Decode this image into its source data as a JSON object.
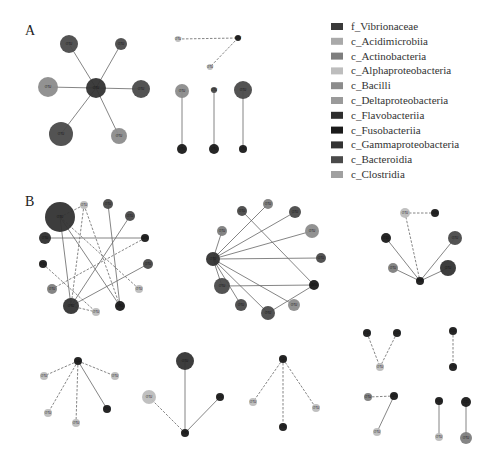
{
  "panels": [
    {
      "id": "A",
      "label": "A"
    },
    {
      "id": "B",
      "label": "B"
    }
  ],
  "legend": {
    "items": [
      {
        "label": "f_Vibrionaceae",
        "color": "#3a3a3a"
      },
      {
        "label": "c_Acidimicrobiia",
        "color": "#a9a9a9"
      },
      {
        "label": "c_Actinobacteria",
        "color": "#7e7e7e"
      },
      {
        "label": "c_Alphaproteobacteria",
        "color": "#bdbdbd"
      },
      {
        "label": "c_Bacilli",
        "color": "#8c8c8c"
      },
      {
        "label": "c_Deltaproteobacteria",
        "color": "#9a9a9a"
      },
      {
        "label": "c_Flavobacteriia",
        "color": "#2e2e2e"
      },
      {
        "label": "c_Fusobacteriia",
        "color": "#1a1a1a"
      },
      {
        "label": "c_Gammaproteobacteria",
        "color": "#333333"
      },
      {
        "label": "c_Bacteroidia",
        "color": "#4a4a4a"
      },
      {
        "label": "c_Clostridia",
        "color": "#a0a0a0"
      }
    ]
  },
  "edge_styles": {
    "positive": "solid",
    "negative": "dashed"
  },
  "networks": [
    {
      "panel": "A",
      "nodes": [
        {
          "id": "a1c",
          "label": "OTU",
          "cls": 8,
          "x": 96,
          "y": 88,
          "r": 10
        },
        {
          "id": "a1n1",
          "label": "OTU",
          "cls": 9,
          "x": 69,
          "y": 44,
          "r": 9
        },
        {
          "id": "a1n2",
          "label": "OTU",
          "cls": 9,
          "x": 121,
          "y": 44,
          "r": 6
        },
        {
          "id": "a1n3",
          "label": "OTU",
          "cls": 4,
          "x": 48,
          "y": 87,
          "r": 10
        },
        {
          "id": "a1n4",
          "label": "OTU",
          "cls": 9,
          "x": 141,
          "y": 89,
          "r": 9
        },
        {
          "id": "a1n5",
          "label": "OTU",
          "cls": 9,
          "x": 61,
          "y": 134,
          "r": 12
        },
        {
          "id": "a1n6",
          "label": "OTU",
          "cls": 4,
          "x": 119,
          "y": 136,
          "r": 8
        }
      ],
      "edges": [
        [
          "a1c",
          "a1n1",
          "solid"
        ],
        [
          "a1c",
          "a1n2",
          "solid"
        ],
        [
          "a1c",
          "a1n3",
          "solid"
        ],
        [
          "a1c",
          "a1n4",
          "solid"
        ],
        [
          "a1c",
          "a1n5",
          "solid"
        ],
        [
          "a1c",
          "a1n6",
          "solid"
        ]
      ]
    },
    {
      "panel": "A",
      "nodes": [
        {
          "id": "a2a",
          "label": "OTU",
          "cls": 3,
          "x": 178,
          "y": 39,
          "r": 3
        },
        {
          "id": "a2b",
          "label": "OTU",
          "cls": 7,
          "x": 238,
          "y": 38,
          "r": 3
        },
        {
          "id": "a2c",
          "label": "OTU",
          "cls": 3,
          "x": 210,
          "y": 67,
          "r": 3
        }
      ],
      "edges": [
        [
          "a2a",
          "a2b",
          "dashed"
        ],
        [
          "a2b",
          "a2c",
          "dashed"
        ]
      ]
    },
    {
      "panel": "A",
      "nodes": [
        {
          "id": "a3a",
          "label": "OTU",
          "cls": 4,
          "x": 182,
          "y": 91,
          "r": 7
        },
        {
          "id": "a3b",
          "label": "OTU",
          "cls": 7,
          "x": 182,
          "y": 149,
          "r": 5
        },
        {
          "id": "a3c",
          "label": "OTU",
          "cls": 9,
          "x": 214,
          "y": 90,
          "r": 3
        },
        {
          "id": "a3d",
          "label": "OTU",
          "cls": 7,
          "x": 214,
          "y": 149,
          "r": 5
        },
        {
          "id": "a3e",
          "label": "OTU",
          "cls": 9,
          "x": 243,
          "y": 90,
          "r": 9
        },
        {
          "id": "a3f",
          "label": "OTU",
          "cls": 7,
          "x": 243,
          "y": 149,
          "r": 4
        }
      ],
      "edges": [
        [
          "a3a",
          "a3b",
          "solid"
        ],
        [
          "a3c",
          "a3d",
          "solid"
        ],
        [
          "a3e",
          "a3f",
          "solid"
        ]
      ]
    },
    {
      "panel": "B",
      "nodes": [
        {
          "id": "b1a",
          "label": "OTU",
          "cls": 8,
          "x": 60,
          "y": 217,
          "r": 15
        },
        {
          "id": "b1b",
          "label": "OTU",
          "cls": 3,
          "x": 84,
          "y": 205,
          "r": 4
        },
        {
          "id": "b1c",
          "label": "OTU",
          "cls": 9,
          "x": 108,
          "y": 204,
          "r": 5
        },
        {
          "id": "b1d",
          "label": "OTU",
          "cls": 9,
          "x": 130,
          "y": 216,
          "r": 5
        },
        {
          "id": "b1e",
          "label": "OTU",
          "cls": 6,
          "x": 45,
          "y": 238,
          "r": 6
        },
        {
          "id": "b1f",
          "label": "OTU",
          "cls": 7,
          "x": 145,
          "y": 238,
          "r": 4
        },
        {
          "id": "b1g",
          "label": "OTU",
          "cls": 7,
          "x": 43,
          "y": 264,
          "r": 4
        },
        {
          "id": "b1h",
          "label": "OTU",
          "cls": 9,
          "x": 148,
          "y": 264,
          "r": 5
        },
        {
          "id": "b1i",
          "label": "OTU",
          "cls": 2,
          "x": 52,
          "y": 289,
          "r": 5
        },
        {
          "id": "b1j",
          "label": "OTU",
          "cls": 3,
          "x": 139,
          "y": 289,
          "r": 4
        },
        {
          "id": "b1k",
          "label": "OTU",
          "cls": 8,
          "x": 71,
          "y": 306,
          "r": 8
        },
        {
          "id": "b1l",
          "label": "OTU",
          "cls": 3,
          "x": 96,
          "y": 312,
          "r": 4
        },
        {
          "id": "b1m",
          "label": "OTU",
          "cls": 7,
          "x": 120,
          "y": 306,
          "r": 5
        }
      ],
      "edges": [
        [
          "b1a",
          "b1b",
          "dashed"
        ],
        [
          "b1a",
          "b1k",
          "solid"
        ],
        [
          "b1a",
          "b1m",
          "solid"
        ],
        [
          "b1a",
          "b1j",
          "dashed"
        ],
        [
          "b1e",
          "b1f",
          "solid"
        ],
        [
          "b1c",
          "b1m",
          "solid"
        ],
        [
          "b1d",
          "b1k",
          "solid"
        ],
        [
          "b1h",
          "b1k",
          "solid"
        ],
        [
          "b1b",
          "b1k",
          "dashed"
        ],
        [
          "b1b",
          "b1m",
          "dashed"
        ],
        [
          "b1f",
          "b1i",
          "dashed"
        ],
        [
          "b1g",
          "b1l",
          "dashed"
        ],
        [
          "b1k",
          "b1l",
          "dashed"
        ]
      ]
    },
    {
      "panel": "B",
      "nodes": [
        {
          "id": "b2c",
          "label": "OTU",
          "cls": 8,
          "x": 213,
          "y": 259,
          "r": 7
        },
        {
          "id": "b2a",
          "label": "OTU",
          "cls": 9,
          "x": 242,
          "y": 211,
          "r": 5
        },
        {
          "id": "b2b",
          "label": "OTU",
          "cls": 2,
          "x": 268,
          "y": 204,
          "r": 5
        },
        {
          "id": "b2d",
          "label": "OTU",
          "cls": 9,
          "x": 295,
          "y": 212,
          "r": 6
        },
        {
          "id": "b2e",
          "label": "OTU",
          "cls": 2,
          "x": 222,
          "y": 231,
          "r": 5
        },
        {
          "id": "b2f",
          "label": "OTU",
          "cls": 4,
          "x": 312,
          "y": 231,
          "r": 7
        },
        {
          "id": "b2g",
          "label": "OTU",
          "cls": 9,
          "x": 321,
          "y": 258,
          "r": 5
        },
        {
          "id": "b2h",
          "label": "OTU",
          "cls": 9,
          "x": 222,
          "y": 286,
          "r": 8
        },
        {
          "id": "b2i",
          "label": "OTU",
          "cls": 7,
          "x": 314,
          "y": 285,
          "r": 5
        },
        {
          "id": "b2j",
          "label": "OTU",
          "cls": 9,
          "x": 241,
          "y": 305,
          "r": 6
        },
        {
          "id": "b2k",
          "label": "OTU",
          "cls": 4,
          "x": 294,
          "y": 305,
          "r": 6
        },
        {
          "id": "b2l",
          "label": "OTU",
          "cls": 9,
          "x": 268,
          "y": 313,
          "r": 7
        }
      ],
      "edges": [
        [
          "b2c",
          "b2b",
          "solid"
        ],
        [
          "b2c",
          "b2d",
          "solid"
        ],
        [
          "b2c",
          "b2e",
          "solid"
        ],
        [
          "b2c",
          "b2f",
          "solid"
        ],
        [
          "b2c",
          "b2g",
          "solid"
        ],
        [
          "b2c",
          "b2h",
          "solid"
        ],
        [
          "b2c",
          "b2j",
          "solid"
        ],
        [
          "b2c",
          "b2l",
          "solid"
        ],
        [
          "b2c",
          "b2k",
          "solid"
        ],
        [
          "b2a",
          "b2i",
          "solid"
        ],
        [
          "b2h",
          "b2i",
          "solid"
        ],
        [
          "b2l",
          "b2i",
          "solid"
        ]
      ]
    },
    {
      "panel": "B",
      "nodes": [
        {
          "id": "b3a",
          "label": "OTU",
          "cls": 3,
          "x": 405,
          "y": 213,
          "r": 5
        },
        {
          "id": "b3b",
          "label": "OTU",
          "cls": 7,
          "x": 435,
          "y": 213,
          "r": 4
        },
        {
          "id": "b3c",
          "label": "OTU",
          "cls": 7,
          "x": 386,
          "y": 238,
          "r": 5
        },
        {
          "id": "b3d",
          "label": "OTU",
          "cls": 9,
          "x": 455,
          "y": 238,
          "r": 7
        },
        {
          "id": "b3e",
          "label": "OTU",
          "cls": 2,
          "x": 393,
          "y": 268,
          "r": 5
        },
        {
          "id": "b3f",
          "label": "OTU",
          "cls": 8,
          "x": 448,
          "y": 268,
          "r": 8
        },
        {
          "id": "b3g",
          "label": "OTU",
          "cls": 7,
          "x": 420,
          "y": 281,
          "r": 4
        }
      ],
      "edges": [
        [
          "b3a",
          "b3b",
          "dashed"
        ],
        [
          "b3a",
          "b3g",
          "dashed"
        ],
        [
          "b3c",
          "b3g",
          "solid"
        ],
        [
          "b3d",
          "b3g",
          "solid"
        ],
        [
          "b3e",
          "b3g",
          "solid"
        ],
        [
          "b3f",
          "b3g",
          "solid"
        ]
      ]
    },
    {
      "panel": "B",
      "nodes": [
        {
          "id": "b4a",
          "label": "OTU",
          "cls": 7,
          "x": 78,
          "y": 361,
          "r": 4
        },
        {
          "id": "b4b",
          "label": "OTU",
          "cls": 3,
          "x": 44,
          "y": 376,
          "r": 4
        },
        {
          "id": "b4c",
          "label": "OTU",
          "cls": 3,
          "x": 115,
          "y": 376,
          "r": 4
        },
        {
          "id": "b4d",
          "label": "OTU",
          "cls": 3,
          "x": 48,
          "y": 413,
          "r": 4
        },
        {
          "id": "b4e",
          "label": "OTU",
          "cls": 3,
          "x": 76,
          "y": 423,
          "r": 4
        },
        {
          "id": "b4f",
          "label": "OTU",
          "cls": 7,
          "x": 107,
          "y": 409,
          "r": 4
        }
      ],
      "edges": [
        [
          "b4a",
          "b4b",
          "dashed"
        ],
        [
          "b4a",
          "b4c",
          "dashed"
        ],
        [
          "b4a",
          "b4d",
          "dashed"
        ],
        [
          "b4a",
          "b4e",
          "dashed"
        ],
        [
          "b4a",
          "b4f",
          "solid"
        ]
      ]
    },
    {
      "panel": "B",
      "nodes": [
        {
          "id": "b5a",
          "label": "OTU",
          "cls": 8,
          "x": 185,
          "y": 361,
          "r": 9
        },
        {
          "id": "b5b",
          "label": "OTU",
          "cls": 3,
          "x": 149,
          "y": 397,
          "r": 7
        },
        {
          "id": "b5c",
          "label": "OTU",
          "cls": 7,
          "x": 220,
          "y": 397,
          "r": 4
        },
        {
          "id": "b5d",
          "label": "OTU",
          "cls": 7,
          "x": 185,
          "y": 433,
          "r": 4
        }
      ],
      "edges": [
        [
          "b5a",
          "b5d",
          "solid"
        ],
        [
          "b5b",
          "b5d",
          "dashed"
        ],
        [
          "b5c",
          "b5d",
          "solid"
        ]
      ]
    },
    {
      "panel": "B",
      "nodes": [
        {
          "id": "b6a",
          "label": "OTU",
          "cls": 7,
          "x": 283,
          "y": 359,
          "r": 4
        },
        {
          "id": "b6b",
          "label": "OTU",
          "cls": 3,
          "x": 253,
          "y": 402,
          "r": 4
        },
        {
          "id": "b6c",
          "label": "OTU",
          "cls": 3,
          "x": 316,
          "y": 408,
          "r": 4
        },
        {
          "id": "b6d",
          "label": "OTU",
          "cls": 7,
          "x": 283,
          "y": 427,
          "r": 4
        }
      ],
      "edges": [
        [
          "b6a",
          "b6b",
          "dashed"
        ],
        [
          "b6a",
          "b6c",
          "dashed"
        ],
        [
          "b6a",
          "b6d",
          "dashed"
        ]
      ]
    },
    {
      "panel": "B",
      "nodes": [
        {
          "id": "b7a",
          "label": "OTU",
          "cls": 7,
          "x": 367,
          "y": 333,
          "r": 4
        },
        {
          "id": "b7b",
          "label": "OTU",
          "cls": 7,
          "x": 397,
          "y": 333,
          "r": 4
        },
        {
          "id": "b7c",
          "label": "OTU",
          "cls": 3,
          "x": 380,
          "y": 367,
          "r": 4
        }
      ],
      "edges": [
        [
          "b7a",
          "b7c",
          "dashed"
        ],
        [
          "b7b",
          "b7c",
          "dashed"
        ]
      ]
    },
    {
      "panel": "B",
      "nodes": [
        {
          "id": "b8a",
          "label": "OTU",
          "cls": 7,
          "x": 453,
          "y": 331,
          "r": 4
        },
        {
          "id": "b8b",
          "label": "OTU",
          "cls": 7,
          "x": 453,
          "y": 367,
          "r": 4
        }
      ],
      "edges": [
        [
          "b8a",
          "b8b",
          "dashed"
        ]
      ]
    },
    {
      "panel": "B",
      "nodes": [
        {
          "id": "b9a",
          "label": "OTU",
          "cls": 2,
          "x": 368,
          "y": 397,
          "r": 4
        },
        {
          "id": "b9b",
          "label": "OTU",
          "cls": 7,
          "x": 394,
          "y": 396,
          "r": 4
        },
        {
          "id": "b9c",
          "label": "OTU",
          "cls": 3,
          "x": 377,
          "y": 432,
          "r": 4
        }
      ],
      "edges": [
        [
          "b9a",
          "b9b",
          "dashed"
        ],
        [
          "b9b",
          "b9c",
          "solid"
        ]
      ]
    },
    {
      "panel": "B",
      "nodes": [
        {
          "id": "b10a",
          "label": "OTU",
          "cls": 7,
          "x": 439,
          "y": 401,
          "r": 4
        },
        {
          "id": "b10b",
          "label": "OTU",
          "cls": 3,
          "x": 439,
          "y": 437,
          "r": 4
        },
        {
          "id": "b10c",
          "label": "OTU",
          "cls": 7,
          "x": 466,
          "y": 402,
          "r": 5
        },
        {
          "id": "b10d",
          "label": "OTU",
          "cls": 2,
          "x": 466,
          "y": 438,
          "r": 6
        }
      ],
      "edges": [
        [
          "b10a",
          "b10b",
          "solid"
        ],
        [
          "b10c",
          "b10d",
          "solid"
        ]
      ]
    }
  ]
}
